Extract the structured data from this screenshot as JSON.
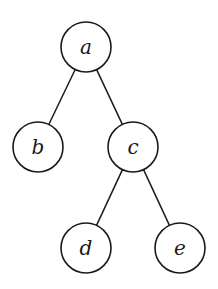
{
  "diagram": {
    "type": "tree",
    "stroke_color": "#1a1a1a",
    "background": "#ffffff",
    "node_radius": 25,
    "nodes": [
      {
        "id": "a",
        "label": "a",
        "x": 86,
        "y": 47
      },
      {
        "id": "b",
        "label": "b",
        "x": 38,
        "y": 147
      },
      {
        "id": "c",
        "label": "c",
        "x": 133,
        "y": 147
      },
      {
        "id": "d",
        "label": "d",
        "x": 86,
        "y": 248
      },
      {
        "id": "e",
        "label": "e",
        "x": 180,
        "y": 248
      }
    ],
    "edges": [
      {
        "from": "a",
        "to": "b"
      },
      {
        "from": "a",
        "to": "c"
      },
      {
        "from": "c",
        "to": "d"
      },
      {
        "from": "c",
        "to": "e"
      }
    ]
  }
}
